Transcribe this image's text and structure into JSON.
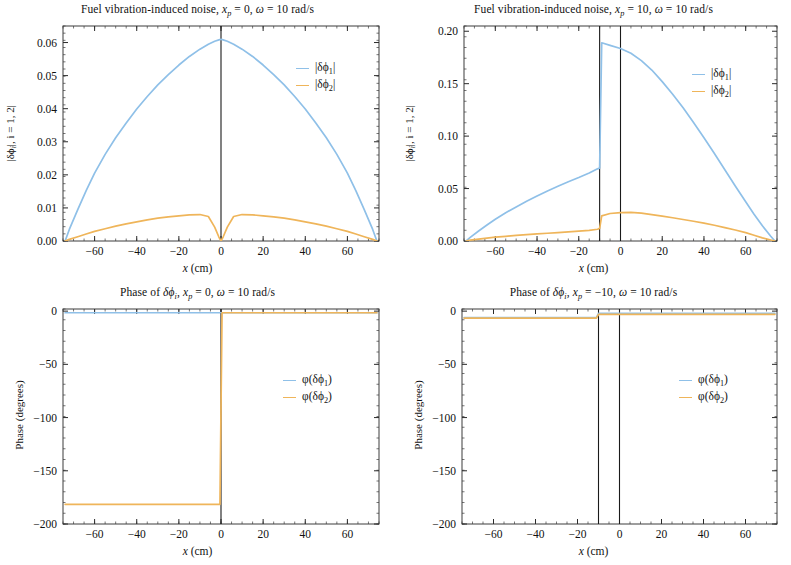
{
  "figure": {
    "width": 791,
    "height": 565,
    "background": "#ffffff",
    "series_colors": {
      "phi1": "#8fc0e8",
      "phi2": "#efb55a",
      "marker_line": "#1a1a1a",
      "frame": "#3a3a3a"
    }
  },
  "panels": {
    "top_left": {
      "title": "Fuel vibration-induced noise, x_p = 0, ω = 10 rad/s",
      "title_parts": {
        "lead": "Fuel vibration-induced noise, ",
        "var": "x",
        "var_sub": "p",
        "eq1": " = 0, ",
        "omega": "ω",
        "eq2": " = 10 rad/s"
      },
      "xlabel": "x (cm)",
      "ylabel": "|δϕᵢ|, i = 1, 2|",
      "ylabel_parts": {
        "pre": "|δϕ",
        "sub": "i",
        "post": "|, i = 1, 2|"
      },
      "xticks": [
        -60,
        -40,
        -20,
        0,
        20,
        40,
        60
      ],
      "xticklabels": [
        "-60",
        "-40",
        "-20",
        "0",
        "20",
        "40",
        "60"
      ],
      "yticks": [
        0.0,
        0.01,
        0.02,
        0.03,
        0.04,
        0.05,
        0.06
      ],
      "yticklabels": [
        "0.00",
        "0.01",
        "0.02",
        "0.03",
        "0.04",
        "0.05",
        "0.06"
      ],
      "xlim": [
        -75,
        75
      ],
      "ylim": [
        0.0,
        0.065
      ],
      "vlines": [
        0
      ],
      "legend": [
        {
          "label": "|δϕ₁|",
          "pre": "|δϕ",
          "sub": "1",
          "post": "|",
          "color": "#8fc0e8"
        },
        {
          "label": "|δϕ₂|",
          "pre": "|δϕ",
          "sub": "2",
          "post": "|",
          "color": "#efb55a"
        }
      ]
    },
    "top_right": {
      "title": "Fuel vibration-induced noise, x_p = 10, ω = 10 rad/s",
      "title_parts": {
        "lead": "Fuel vibration-induced noise, ",
        "var": "x",
        "var_sub": "p",
        "eq1": " = 10, ",
        "omega": "ω",
        "eq2": " = 10 rad/s"
      },
      "xlabel": "x (cm)",
      "ylabel": "|δϕᵢ|, i = 1, 2|",
      "ylabel_parts": {
        "pre": "|δϕ",
        "sub": "i",
        "post": "|, i = 1, 2|"
      },
      "xticks": [
        -60,
        -40,
        -20,
        0,
        20,
        40,
        60
      ],
      "xticklabels": [
        "-60",
        "-40",
        "-20",
        "0",
        "20",
        "40",
        "60"
      ],
      "yticks": [
        0.0,
        0.05,
        0.1,
        0.15,
        0.2
      ],
      "yticklabels": [
        "0.00",
        "0.05",
        "0.10",
        "0.15",
        "0.20"
      ],
      "xlim": [
        -75,
        75
      ],
      "ylim": [
        0.0,
        0.205
      ],
      "vlines": [
        -10,
        0
      ],
      "legend": [
        {
          "label": "|δϕ₁|",
          "pre": "|δϕ",
          "sub": "1",
          "post": "|",
          "color": "#8fc0e8"
        },
        {
          "label": "|δϕ₂|",
          "pre": "|δϕ",
          "sub": "2",
          "post": "|",
          "color": "#efb55a"
        }
      ]
    },
    "bottom_left": {
      "title": "Phase of δϕ_i, x_p = 0, ω = 10 rad/s",
      "title_parts": {
        "lead": "Phase of ",
        "delta": "δϕ",
        "delta_sub": "i",
        "comma": ", ",
        "var": "x",
        "var_sub": "p",
        "eq1": " = 0, ",
        "omega": "ω",
        "eq2": " = 10 rad/s"
      },
      "xlabel": "x (cm)",
      "ylabel": "Phase (degrees)",
      "xticks": [
        -60,
        -40,
        -20,
        0,
        20,
        40,
        60
      ],
      "xticklabels": [
        "-60",
        "-40",
        "-20",
        "0",
        "20",
        "40",
        "60"
      ],
      "yticks": [
        -200,
        -150,
        -100,
        -50,
        0
      ],
      "yticklabels": [
        "-200",
        "-150",
        "-100",
        "-50",
        "0"
      ],
      "xlim": [
        -75,
        75
      ],
      "ylim": [
        -200,
        2
      ],
      "vlines": [
        0
      ],
      "legend": [
        {
          "label": "φ(δϕ₁)",
          "pre": "φ(δϕ",
          "sub": "1",
          "post": ")",
          "color": "#8fc0e8"
        },
        {
          "label": "φ(δϕ₂)",
          "pre": "φ(δϕ",
          "sub": "2",
          "post": ")",
          "color": "#efb55a"
        }
      ]
    },
    "bottom_right": {
      "title": "Phase of δϕ_i, x_p = -10, ω = 10 rad/s",
      "title_parts": {
        "lead": "Phase of ",
        "delta": "δϕ",
        "delta_sub": "i",
        "comma": ", ",
        "var": "x",
        "var_sub": "p",
        "eq1": " = −10, ",
        "omega": "ω",
        "eq2": " = 10 rad/s"
      },
      "xlabel": "x (cm)",
      "ylabel": "Phase (degrees)",
      "xticks": [
        -60,
        -40,
        -20,
        0,
        20,
        40,
        60
      ],
      "xticklabels": [
        "-60",
        "-40",
        "-20",
        "0",
        "20",
        "40",
        "60"
      ],
      "yticks": [
        -200,
        -150,
        -100,
        -50,
        0
      ],
      "yticklabels": [
        "-200",
        "-150",
        "-100",
        "-50",
        "0"
      ],
      "xlim": [
        -75,
        75
      ],
      "ylim": [
        -200,
        2
      ],
      "vlines": [
        -10,
        0
      ],
      "legend": [
        {
          "label": "φ(δϕ₁)",
          "pre": "φ(δϕ",
          "sub": "1",
          "post": ")",
          "color": "#8fc0e8"
        },
        {
          "label": "φ(δϕ₂)",
          "pre": "φ(δϕ",
          "sub": "2",
          "post": ")",
          "color": "#efb55a"
        }
      ]
    }
  },
  "chart_data": [
    {
      "panel": "top_left",
      "type": "line",
      "title": "Fuel vibration-induced noise, x_p = 0, ω = 10 rad/s",
      "xlabel": "x (cm)",
      "ylabel": "|δϕ_i|, i = 1, 2",
      "xlim": [
        -75,
        75
      ],
      "ylim": [
        0.0,
        0.065
      ],
      "grid": false,
      "legend_position": "upper right",
      "annotations": [
        {
          "type": "vline",
          "x": 0
        }
      ],
      "x": [
        -74,
        -72,
        -68,
        -64,
        -60,
        -55,
        -50,
        -45,
        -40,
        -35,
        -30,
        -25,
        -20,
        -15,
        -10,
        -6,
        -3,
        -1,
        0,
        1,
        3,
        6,
        10,
        15,
        20,
        25,
        30,
        35,
        40,
        45,
        50,
        55,
        60,
        64,
        68,
        72,
        74
      ],
      "series": [
        {
          "name": "|δϕ₁|",
          "color": "#8fc0e8",
          "values": [
            0.0,
            0.0035,
            0.0095,
            0.0152,
            0.0205,
            0.0262,
            0.0312,
            0.0357,
            0.0399,
            0.0437,
            0.0472,
            0.0503,
            0.0532,
            0.0558,
            0.058,
            0.0595,
            0.0604,
            0.0608,
            0.061,
            0.0608,
            0.0604,
            0.0595,
            0.058,
            0.0558,
            0.0532,
            0.0503,
            0.0472,
            0.0437,
            0.0399,
            0.0357,
            0.0312,
            0.0262,
            0.0205,
            0.0152,
            0.0095,
            0.0035,
            0.0
          ]
        },
        {
          "name": "|δϕ₂|",
          "color": "#efb55a",
          "values": [
            0.0,
            0.0005,
            0.0013,
            0.0021,
            0.0029,
            0.0037,
            0.0045,
            0.0052,
            0.0058,
            0.0064,
            0.0069,
            0.0073,
            0.0076,
            0.0079,
            0.008,
            0.0074,
            0.0042,
            0.0012,
            0.0,
            0.0012,
            0.0042,
            0.0074,
            0.008,
            0.0079,
            0.0076,
            0.0073,
            0.0069,
            0.0064,
            0.0058,
            0.0052,
            0.0045,
            0.0037,
            0.0029,
            0.0021,
            0.0013,
            0.0005,
            0.0
          ]
        }
      ]
    },
    {
      "panel": "top_right",
      "type": "line",
      "title": "Fuel vibration-induced noise, x_p = 10, ω = 10 rad/s",
      "xlabel": "x (cm)",
      "ylabel": "|δϕ_i|, i = 1, 2",
      "xlim": [
        -75,
        75
      ],
      "ylim": [
        0.0,
        0.205
      ],
      "grid": false,
      "legend_position": "upper right",
      "annotations": [
        {
          "type": "vline",
          "x": -10
        },
        {
          "type": "vline",
          "x": 0
        }
      ],
      "x": [
        -74,
        -72,
        -68,
        -64,
        -60,
        -55,
        -50,
        -45,
        -40,
        -35,
        -30,
        -25,
        -20,
        -15,
        -11,
        -10,
        -9,
        -5,
        0,
        5,
        10,
        15,
        20,
        25,
        30,
        35,
        40,
        45,
        50,
        55,
        60,
        64,
        68,
        72,
        74
      ],
      "series": [
        {
          "name": "|δϕ₁|",
          "color": "#8fc0e8",
          "values": [
            0.0,
            0.0035,
            0.0095,
            0.0152,
            0.0207,
            0.027,
            0.0325,
            0.0378,
            0.0428,
            0.0477,
            0.0522,
            0.0565,
            0.0605,
            0.0648,
            0.0688,
            0.0695,
            0.189,
            0.1865,
            0.1835,
            0.179,
            0.172,
            0.163,
            0.152,
            0.14,
            0.127,
            0.113,
            0.0985,
            0.0835,
            0.068,
            0.0525,
            0.0375,
            0.0255,
            0.0145,
            0.0045,
            0.0
          ]
        },
        {
          "name": "|δϕ₂|",
          "color": "#efb55a",
          "values": [
            0.0,
            0.0008,
            0.0018,
            0.0028,
            0.0036,
            0.0045,
            0.0053,
            0.006,
            0.0067,
            0.0074,
            0.008,
            0.0087,
            0.0094,
            0.0102,
            0.0112,
            0.012,
            0.024,
            0.0262,
            0.027,
            0.0272,
            0.0265,
            0.0252,
            0.0238,
            0.0222,
            0.0205,
            0.0188,
            0.017,
            0.015,
            0.0128,
            0.0105,
            0.008,
            0.0055,
            0.003,
            0.001,
            0.0
          ]
        }
      ]
    },
    {
      "panel": "bottom_left",
      "type": "line",
      "title": "Phase of δϕ_i, x_p = 0, ω = 10 rad/s",
      "xlabel": "x (cm)",
      "ylabel": "Phase (degrees)",
      "xlim": [
        -75,
        75
      ],
      "ylim": [
        -200,
        2
      ],
      "grid": false,
      "legend_position": "center right",
      "annotations": [
        {
          "type": "vline",
          "x": 0
        }
      ],
      "x": [
        -74,
        -60,
        -40,
        -20,
        -5,
        -0.5,
        0.5,
        5,
        20,
        40,
        60,
        74
      ],
      "series": [
        {
          "name": "φ(δϕ₁)",
          "color": "#8fc0e8",
          "values": [
            -1.5,
            -1.5,
            -1.5,
            -1.5,
            -1.5,
            -1.5,
            -1.5,
            -1.5,
            -1.5,
            -1.5,
            -1.5,
            -1.5
          ]
        },
        {
          "name": "φ(δϕ₂)",
          "color": "#efb55a",
          "values": [
            -181.5,
            -181.5,
            -181.5,
            -181.5,
            -181.5,
            -181.5,
            -1.5,
            -1.5,
            -1.5,
            -1.5,
            -1.5,
            -1.5
          ]
        }
      ]
    },
    {
      "panel": "bottom_right",
      "type": "line",
      "title": "Phase of δϕ_i, x_p = -10, ω = 10 rad/s",
      "xlabel": "x (cm)",
      "ylabel": "Phase (degrees)",
      "xlim": [
        -75,
        75
      ],
      "ylim": [
        -200,
        2
      ],
      "grid": false,
      "legend_position": "center right",
      "annotations": [
        {
          "type": "vline",
          "x": -10
        },
        {
          "type": "vline",
          "x": 0
        }
      ],
      "x": [
        -74,
        -60,
        -40,
        -20,
        -11,
        -10,
        -5,
        0,
        20,
        40,
        60,
        74
      ],
      "series": [
        {
          "name": "φ(δϕ₁)",
          "color": "#8fc0e8",
          "values": [
            -6.0,
            -6.0,
            -6.0,
            -6.0,
            -6.0,
            -2.0,
            -2.0,
            -2.0,
            -2.0,
            -2.0,
            -2.0,
            -2.0
          ]
        },
        {
          "name": "φ(δϕ₂)",
          "color": "#efb55a",
          "values": [
            -6.5,
            -6.5,
            -6.5,
            -6.5,
            -6.5,
            -3.0,
            -3.0,
            -3.0,
            -3.0,
            -3.0,
            -3.0,
            -3.0
          ]
        }
      ]
    }
  ]
}
